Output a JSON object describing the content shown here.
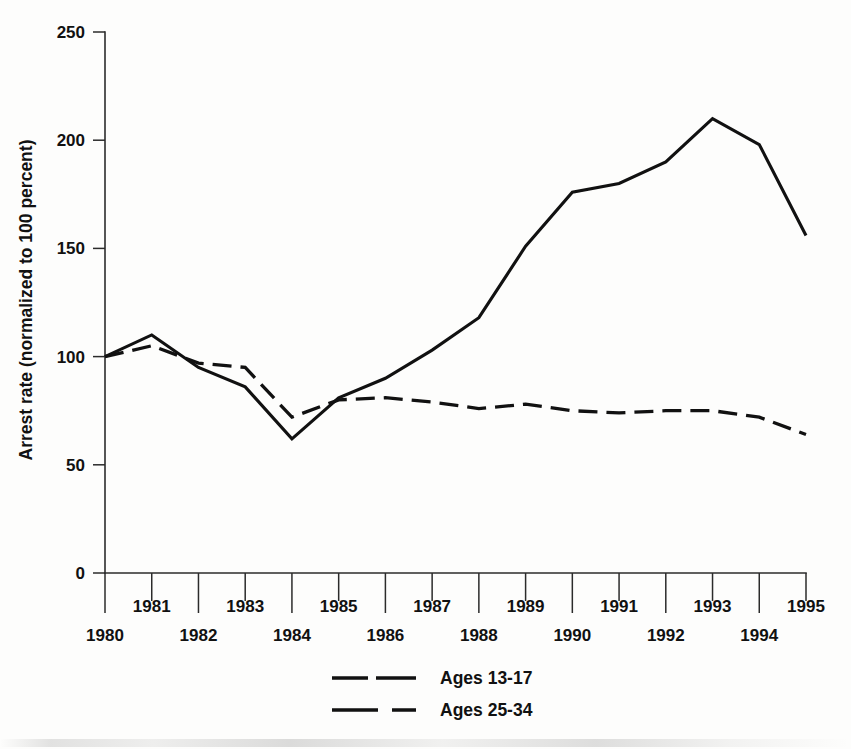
{
  "chart_data": {
    "type": "line",
    "title": "",
    "subtitle": "",
    "xlabel": "",
    "ylabel": "Arrest rate (normalized to 100 percent)",
    "x": [
      1980,
      1981,
      1982,
      1983,
      1984,
      1985,
      1986,
      1987,
      1988,
      1989,
      1990,
      1991,
      1992,
      1993,
      1994,
      1995
    ],
    "xlim": [
      1980,
      1995
    ],
    "ylim": [
      0,
      250
    ],
    "yticks": [
      0,
      50,
      100,
      150,
      200,
      250
    ],
    "ytick_labels": [
      "0",
      "50",
      "100",
      "150",
      "200",
      "250"
    ],
    "xticks": [
      1980,
      1981,
      1982,
      1983,
      1984,
      1985,
      1986,
      1987,
      1988,
      1989,
      1990,
      1991,
      1992,
      1993,
      1994,
      1995
    ],
    "xtick_labels_upper": [
      "",
      "1981",
      "",
      "1983",
      "",
      "1985",
      "",
      "1987",
      "",
      "1989",
      "",
      "1991",
      "",
      "1993",
      "",
      "1995"
    ],
    "xtick_labels_lower": [
      "1980",
      "",
      "1982",
      "",
      "1984",
      "",
      "1986",
      "",
      "1988",
      "",
      "1990",
      "",
      "1992",
      "",
      "1994",
      ""
    ],
    "grid": false,
    "legend_position": "bottom-center",
    "series": [
      {
        "name": "Ages 13-17",
        "style": "solid",
        "values": [
          100,
          110,
          95,
          86,
          62,
          81,
          90,
          103,
          118,
          151,
          176,
          180,
          190,
          210,
          198,
          156
        ]
      },
      {
        "name": "Ages 25-34",
        "style": "dashed",
        "values": [
          100,
          105,
          97,
          95,
          72,
          80,
          81,
          79,
          76,
          78,
          75,
          74,
          75,
          75,
          72,
          64
        ]
      }
    ]
  },
  "axes": {
    "ylabel": "Arrest rate (normalized to 100 percent)"
  },
  "legend": {
    "entries": [
      {
        "label": "Ages 13-17",
        "style": "solid"
      },
      {
        "label": "Ages 25-34",
        "style": "dashed"
      }
    ]
  }
}
